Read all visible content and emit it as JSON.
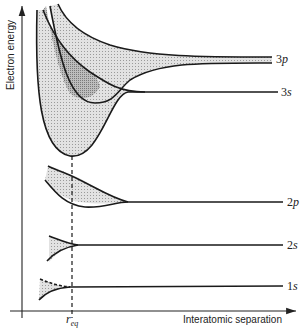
{
  "diagram": {
    "type": "energy-band diagram",
    "y_axis_label": "Electron energy",
    "x_axis_label": "Interatomic separation",
    "marker_label_main": "r",
    "marker_label_sub": "eq",
    "levels": [
      {
        "name": "3p",
        "main": "3",
        "orb": "p"
      },
      {
        "name": "3s",
        "main": "3",
        "orb": "s"
      },
      {
        "name": "2p",
        "main": "2",
        "orb": "p"
      },
      {
        "name": "2s",
        "main": "2",
        "orb": "s"
      },
      {
        "name": "1s",
        "main": "1",
        "orb": "s"
      }
    ],
    "colors": {
      "line": "#1a1a1a",
      "band_fill": "#d4d4d4",
      "overlap_fill": "#a8a8a8",
      "background": "#ffffff"
    }
  }
}
